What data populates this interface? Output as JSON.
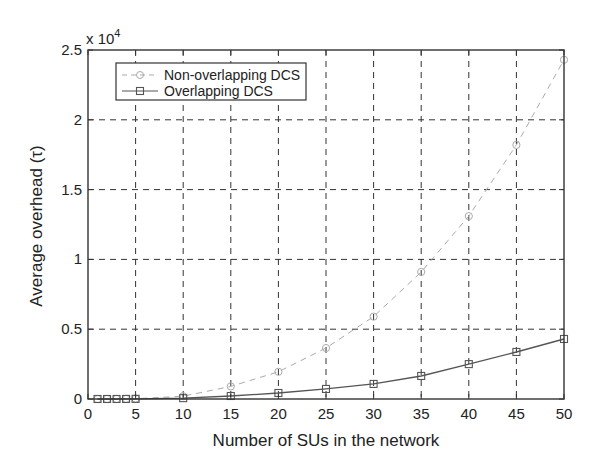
{
  "chart_data": {
    "type": "line",
    "title": "",
    "xlabel": "Number of SUs in the network",
    "ylabel": "Average overhead (τ)",
    "y_multiplier_label": "x 10",
    "y_multiplier_exponent": "4",
    "xlim": [
      0,
      50
    ],
    "ylim": [
      0,
      25000
    ],
    "xticks": [
      0,
      5,
      10,
      15,
      20,
      25,
      30,
      35,
      40,
      45,
      50
    ],
    "yticks": [
      0,
      5000,
      10000,
      15000,
      20000,
      25000
    ],
    "ytick_labels": [
      "0",
      "0.5",
      "1",
      "1.5",
      "2",
      "2.5"
    ],
    "xtick_labels": [
      "0",
      "5",
      "10",
      "15",
      "20",
      "25",
      "30",
      "35",
      "40",
      "45",
      "50"
    ],
    "grid": true,
    "legend_position": "upper left",
    "x": [
      1,
      2,
      3,
      4,
      5,
      10,
      15,
      20,
      25,
      30,
      35,
      40,
      45,
      50
    ],
    "series": [
      {
        "name": "Non-overlapping DCS",
        "color": "#aaaaaa",
        "line_style": "dashed",
        "marker": "circle",
        "values": [
          0,
          1,
          3,
          8,
          25,
          200,
          900,
          1950,
          3650,
          5900,
          9100,
          13100,
          18200,
          24300
        ]
      },
      {
        "name": "Overlapping DCS",
        "color": "#555555",
        "line_style": "solid",
        "marker": "square",
        "values": [
          0,
          1,
          2,
          5,
          10,
          60,
          215,
          430,
          720,
          1080,
          1650,
          2500,
          3370,
          4300
        ]
      }
    ]
  }
}
